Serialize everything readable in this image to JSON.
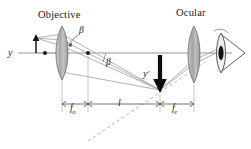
{
  "figure": {
    "kind": "optics-ray-diagram",
    "background_color": "#ffffff",
    "ink_color": "#1a1a1a",
    "ray_color": "#8a8a8a",
    "lens_fill_color": "#b9b9b9",
    "lens_stroke_color": "#6e6e6e",
    "axis_color": "#7d7d7d",
    "dashed_color": "#c2c2c2",
    "arrow_color": "#111111"
  },
  "labels": {
    "objective_title": "Objective",
    "ocular_title": "Ocular",
    "object_height": "y",
    "image_height": "y",
    "image_height_prime": "′",
    "angle_at_objective": "β",
    "angle_at_axis": "β",
    "focal_objective": "f",
    "focal_objective_sub": "o",
    "tube_length": "l",
    "focal_ocular": "f",
    "focal_ocular_sub": "e"
  },
  "elements": {
    "objective_lens": "objective-lens",
    "ocular_lens": "ocular-lens",
    "eye": "eye-symbol",
    "object_arrow": "object-arrow-up",
    "image_arrow": "intermediate-image-arrow-down",
    "optical_axis": "optical-axis",
    "focal_point_objective": "focal-point-dot",
    "focal_point_right": "focal-point-dot",
    "dimension_fo": "dimension-line-fo",
    "dimension_l": "dimension-line-l",
    "dimension_fe": "dimension-line-fe",
    "dashed_ray": "dashed-extension-ray"
  },
  "geometry": {
    "axis_y": 53,
    "objective_x": 62,
    "ocular_x": 194,
    "image_x": 160,
    "image_top_y": 55,
    "image_bottom_y": 92,
    "object_x": 36,
    "object_top_y": 38,
    "dimension_row_y": 104,
    "fo_from": 62,
    "fo_to": 88,
    "l_from": 88,
    "l_to": 160,
    "fe_from": 160,
    "fe_to": 194
  }
}
